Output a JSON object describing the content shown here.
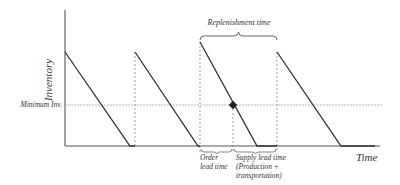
{
  "diagram": {
    "type": "sawtooth inventory diagram",
    "y_axis_label": "Inventory",
    "x_axis_label": "Time",
    "minimum_label": "Minimum Inv.",
    "replenishment_label": "Replenishment time",
    "order_lead_label_line1": "Order",
    "order_lead_label_line2": "lead time",
    "supply_lead_label_line1": "Supply lead time",
    "supply_lead_label_line2": "(Production +",
    "supply_lead_label_line3": "transportation)",
    "colors": {
      "line": "#333333",
      "dashed": "#888888",
      "min_line": "#aaaaaa",
      "background": "#ffffff"
    }
  }
}
